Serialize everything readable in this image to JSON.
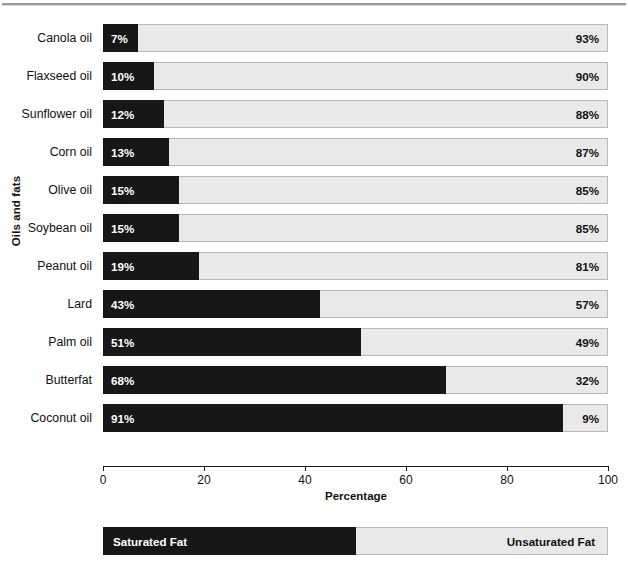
{
  "chart_data": {
    "type": "bar",
    "subtype": "stacked-horizontal-100",
    "title": "",
    "xlabel": "Percentage",
    "ylabel": "Oils and fats",
    "xlim": [
      0,
      100
    ],
    "xticks": [
      "0",
      "20",
      "40",
      "60",
      "80",
      "100"
    ],
    "grid": false,
    "legend_position": "bottom",
    "categories": [
      "Canola oil",
      "Flaxseed oil",
      "Sunflower oil",
      "Corn oil",
      "Olive oil",
      "Soybean oil",
      "Peanut oil",
      "Lard",
      "Palm oil",
      "Butterfat",
      "Coconut oil"
    ],
    "series": [
      {
        "name": "Saturated Fat",
        "color": "#171717",
        "values": [
          7,
          10,
          12,
          13,
          15,
          15,
          19,
          43,
          51,
          68,
          91
        ],
        "labels": [
          "7%",
          "10%",
          "12%",
          "13%",
          "15%",
          "15%",
          "19%",
          "43%",
          "51%",
          "68%",
          "91%"
        ]
      },
      {
        "name": "Unsaturated Fat",
        "color": "#e9e9e9",
        "values": [
          93,
          90,
          88,
          87,
          85,
          85,
          81,
          57,
          49,
          32,
          9
        ],
        "labels": [
          "93%",
          "90%",
          "88%",
          "87%",
          "85%",
          "85%",
          "81%",
          "57%",
          "49%",
          "32%",
          "9%"
        ]
      }
    ]
  },
  "legend": {
    "saturated_label": "Saturated Fat",
    "unsaturated_label": "Unsaturated Fat",
    "split_percent": 50
  }
}
